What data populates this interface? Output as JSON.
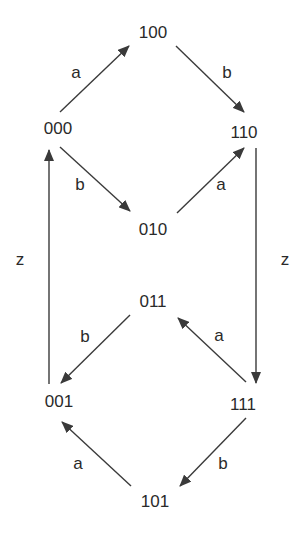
{
  "diagram": {
    "type": "state-transition-graph",
    "colors": {
      "line": "#3a3a3a",
      "text": "#2a2a2a",
      "background": "#ffffff"
    },
    "nodes": [
      {
        "id": "000",
        "label": "000",
        "x": 58,
        "y": 130
      },
      {
        "id": "100",
        "label": "100",
        "x": 153,
        "y": 34
      },
      {
        "id": "110",
        "label": "110",
        "x": 244,
        "y": 134
      },
      {
        "id": "010",
        "label": "010",
        "x": 153,
        "y": 231
      },
      {
        "id": "011",
        "label": "011",
        "x": 153,
        "y": 303
      },
      {
        "id": "001",
        "label": "001",
        "x": 59,
        "y": 403
      },
      {
        "id": "111",
        "label": "111",
        "x": 243,
        "y": 406
      },
      {
        "id": "101",
        "label": "101",
        "x": 155,
        "y": 503
      }
    ],
    "edges": [
      {
        "from": "000",
        "to": "100",
        "label": "a",
        "x1": 60,
        "y1": 112,
        "x2": 129,
        "y2": 46,
        "lx": 76,
        "ly": 74
      },
      {
        "from": "100",
        "to": "110",
        "label": "b",
        "x1": 176,
        "y1": 46,
        "x2": 244,
        "y2": 112,
        "lx": 227,
        "ly": 74
      },
      {
        "from": "000",
        "to": "010",
        "label": "b",
        "x1": 60,
        "y1": 147,
        "x2": 130,
        "y2": 211,
        "lx": 80,
        "ly": 186
      },
      {
        "from": "010",
        "to": "110",
        "label": "a",
        "x1": 177,
        "y1": 213,
        "x2": 244,
        "y2": 148,
        "lx": 221,
        "ly": 186
      },
      {
        "from": "110",
        "to": "111",
        "label": "z",
        "x1": 256,
        "y1": 148,
        "x2": 256,
        "y2": 383,
        "lx": 285,
        "ly": 261
      },
      {
        "from": "001",
        "to": "000",
        "label": "z",
        "x1": 49,
        "y1": 384,
        "x2": 49,
        "y2": 150,
        "lx": 20,
        "ly": 261
      },
      {
        "from": "011",
        "to": "001",
        "label": "b",
        "x1": 130,
        "y1": 315,
        "x2": 61,
        "y2": 383,
        "lx": 85,
        "ly": 338
      },
      {
        "from": "111",
        "to": "011",
        "label": "a",
        "x1": 246,
        "y1": 382,
        "x2": 178,
        "y2": 318,
        "lx": 219,
        "ly": 337
      },
      {
        "from": "111",
        "to": "101",
        "label": "b",
        "x1": 246,
        "y1": 418,
        "x2": 180,
        "y2": 486,
        "lx": 223,
        "ly": 465
      },
      {
        "from": "101",
        "to": "001",
        "label": "a",
        "x1": 131,
        "y1": 486,
        "x2": 62,
        "y2": 422,
        "lx": 78,
        "ly": 465
      }
    ]
  }
}
